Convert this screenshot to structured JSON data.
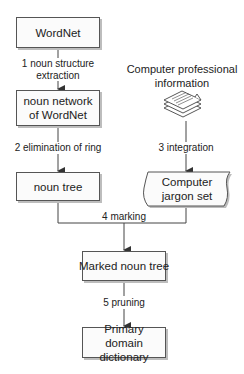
{
  "nodes": {
    "wordnet": "WordNet",
    "noun_network": "noun network of WordNet",
    "noun_tree": "noun tree",
    "source_info": "Computer professional information",
    "jargon_set": "Computer jargon set",
    "marked_noun_tree": "Marked noun tree",
    "primary_dictionary": "Primary domain dictionary"
  },
  "steps": {
    "step1": "1 noun structure extraction",
    "step2": "2 elimination of ring",
    "step3": "3 integration",
    "step4": "4 marking",
    "step5": "5 pruning"
  },
  "icons": {
    "documents": "document-stack-icon"
  },
  "colors": {
    "line": "#444444",
    "box_border": "#555555",
    "box_fill": "#fbfbfb",
    "shadow": "#bdbdbd"
  }
}
